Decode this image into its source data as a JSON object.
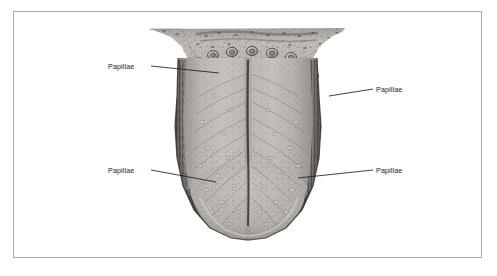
{
  "figure": {
    "style": "grayscale-anatomical-engraving",
    "frame_color": "#a9a9a9",
    "background_color": "#ffffff",
    "ink_color": "#1d1d1d"
  },
  "labels": [
    {
      "id": "papillae-top-left",
      "text": "Papillae",
      "anchor": "right",
      "leader": {
        "x1": 151,
        "y1": 66,
        "x2": 219,
        "y2": 73
      }
    },
    {
      "id": "papillae-top-right",
      "text": "Papillae",
      "anchor": "left",
      "leader": {
        "x1": 373,
        "y1": 89,
        "x2": 329,
        "y2": 96
      }
    },
    {
      "id": "papillae-bottom-left",
      "text": "Papillae",
      "anchor": "right",
      "leader": {
        "x1": 151,
        "y1": 170,
        "x2": 216,
        "y2": 182
      }
    },
    {
      "id": "papillae-bottom-right",
      "text": "Papillae",
      "anchor": "left",
      "leader": {
        "x1": 373,
        "y1": 170,
        "x2": 298,
        "y2": 178
      }
    }
  ],
  "anatomy": {
    "parts": [
      {
        "name": "circumvallate-papillae",
        "description": "row of large rounded papillae in V arrangement at tongue base"
      },
      {
        "name": "median-sulcus",
        "description": "vertical midline groove from base to tip"
      },
      {
        "name": "foliate-papillae",
        "description": "dark vertical hatching along lateral margins"
      },
      {
        "name": "filiform-papillae",
        "description": "fine stippled texture across dorsum"
      },
      {
        "name": "tongue-tip",
        "description": "rounded apex at bottom of illustration"
      }
    ]
  }
}
